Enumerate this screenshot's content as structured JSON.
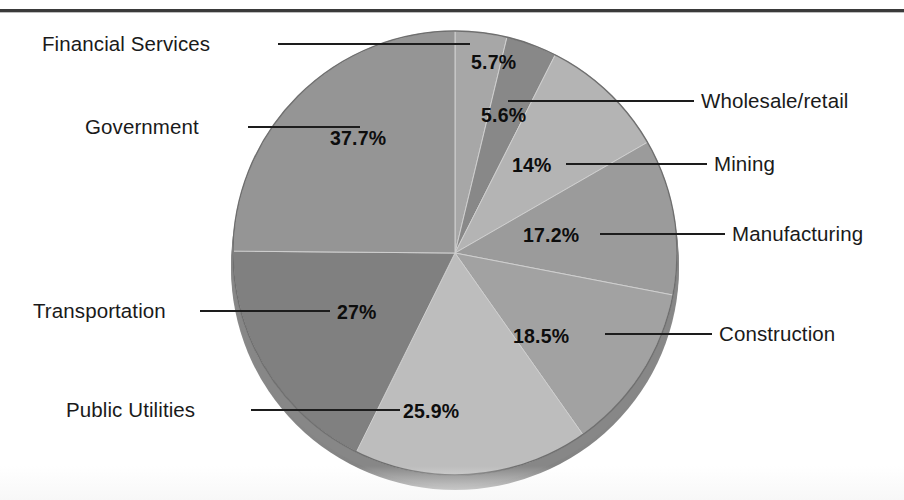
{
  "figure": {
    "background": "#ffffff",
    "has_top_rule": true,
    "title": "",
    "note": ""
  },
  "chart_data": {
    "type": "pie",
    "title": "",
    "subtitle": "",
    "xlabel": "",
    "ylabel": "",
    "grid": false,
    "legend_position": "callout-labels",
    "value_suffix": "%",
    "total_of_values": 151.6,
    "note": "Percentages sum to more than 100% (multiple responses); slices drawn proportional to the total.",
    "start_angle_deg": 0,
    "direction": "clockwise",
    "categories": [
      "Financial Services",
      "Wholesale/retail",
      "Mining",
      "Manufacturing",
      "Construction",
      "Public Utilities",
      "Transportation",
      "Government"
    ],
    "values": [
      5.7,
      5.6,
      14,
      17.2,
      18.5,
      25.9,
      27,
      37.7
    ],
    "labels": [
      "5.7%",
      "5.6%",
      "14%",
      "17.2%",
      "18.5%",
      "25.9%",
      "27%",
      "37.7%"
    ],
    "colors": [
      "#a7a7a7",
      "#888888",
      "#b4b4b4",
      "#9b9b9b",
      "#a2a2a2",
      "#bdbdbd",
      "#808080",
      "#959595"
    ],
    "slices": [
      {
        "name": "Financial Services",
        "value": 5.7,
        "label": "5.7%",
        "color": "#a7a7a7"
      },
      {
        "name": "Wholesale/retail",
        "value": 5.6,
        "label": "5.6%",
        "color": "#888888"
      },
      {
        "name": "Mining",
        "value": 14,
        "label": "14%",
        "color": "#b4b4b4"
      },
      {
        "name": "Manufacturing",
        "value": 17.2,
        "label": "17.2%",
        "color": "#9b9b9b"
      },
      {
        "name": "Construction",
        "value": 18.5,
        "label": "18.5%",
        "color": "#a2a2a2"
      },
      {
        "name": "Public Utilities",
        "value": 25.9,
        "label": "25.9%",
        "color": "#bdbdbd"
      },
      {
        "name": "Transportation",
        "value": 27,
        "label": "27%",
        "color": "#808080"
      },
      {
        "name": "Government",
        "value": 37.7,
        "label": "37.7%",
        "color": "#959595"
      }
    ]
  },
  "callouts": {
    "financial_services": "Financial Services",
    "government": "Government",
    "transportation": "Transportation",
    "public_utilities": "Public Utilities",
    "wholesale_retail": "Wholesale/retail",
    "mining": "Mining",
    "manufacturing": "Manufacturing",
    "construction": "Construction"
  },
  "value_labels": {
    "financial_services": "5.7%",
    "wholesale_retail": "5.6%",
    "mining": "14%",
    "manufacturing": "17.2%",
    "construction": "18.5%",
    "public_utilities": "25.9%",
    "transportation": "27%",
    "government": "37.7%"
  },
  "palette": {
    "rim": "#8e8e8e",
    "rim_shadow": "#7b7b7b",
    "outline": "#6f6f6f",
    "text": "#1a1a1a",
    "leader": "#1d1d1d",
    "rule": "#3a3a3a"
  }
}
